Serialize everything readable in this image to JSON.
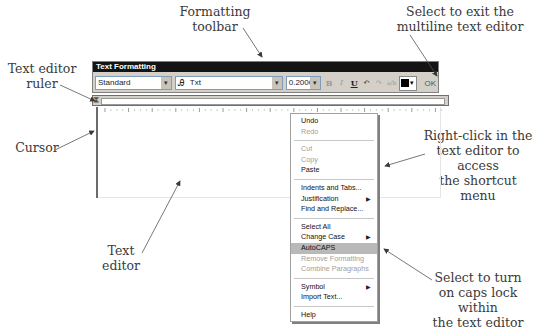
{
  "callouts": {
    "formatting_toolbar": [
      "Formatting",
      "toolbar"
    ],
    "exit_editor": [
      "Select to exit the",
      "multiline text editor"
    ],
    "ruler": [
      "Text editor",
      "ruler"
    ],
    "cursor": "Cursor",
    "right_click": [
      "Right-click in the",
      "text editor to access",
      "the shortcut menu"
    ],
    "text_editor": [
      "Text",
      "editor"
    ],
    "autocaps": [
      "Select to turn",
      "on caps lock within",
      "the text editor"
    ]
  },
  "toolbar": {
    "title": "Text Formatting",
    "style_value": "Standard",
    "font_value": "Txt",
    "font_icon": "font-icon",
    "height_value": "0.2000",
    "bold_label": "B",
    "italic_label": "I",
    "underline_label": "U",
    "undo_icon": "↶",
    "redo_icon": "↷",
    "stack_icon": "a/b",
    "color_value": "#000000",
    "ok_label": "OK",
    "dropdown_icon": "▾"
  },
  "context_menu": {
    "groups": [
      [
        {
          "label": "Undo",
          "enabled": true
        },
        {
          "label": "Redo",
          "enabled": false
        }
      ],
      [
        {
          "label": "Cut",
          "enabled": false
        },
        {
          "label": "Copy",
          "enabled": false
        },
        {
          "label": "Paste",
          "enabled": true
        }
      ],
      [
        {
          "label": "Indents and Tabs...",
          "enabled": true
        },
        {
          "label": "Justification",
          "enabled": true,
          "submenu": true
        },
        {
          "label": "Find and Replace...",
          "enabled": true
        }
      ],
      [
        {
          "label": "Select All",
          "enabled": true
        },
        {
          "label": "Change Case",
          "enabled": true,
          "submenu": true
        },
        {
          "label": "AutoCAPS",
          "enabled": true,
          "selected": true
        },
        {
          "label": "Remove Formatting",
          "enabled": false
        },
        {
          "label": "Combine Paragraphs",
          "enabled": false
        }
      ],
      [
        {
          "label": "Symbol",
          "enabled": true,
          "submenu": true
        },
        {
          "label": "Import Text...",
          "enabled": true
        }
      ],
      [
        {
          "label": "Help",
          "enabled": true
        }
      ]
    ],
    "submenu_icon": "▶"
  }
}
